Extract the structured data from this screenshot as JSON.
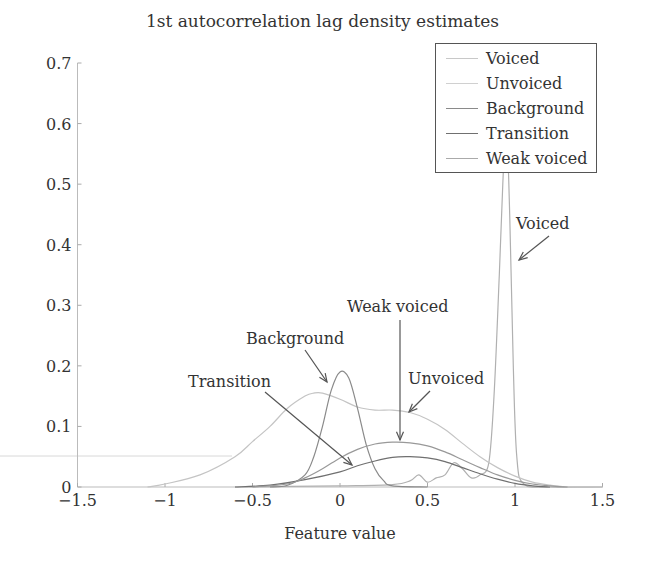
{
  "chart_data": {
    "type": "line",
    "title": "1st autocorrelation lag density estimates",
    "xlabel": "Feature value",
    "ylabel": "",
    "xlim": [
      -1.5,
      1.5
    ],
    "ylim": [
      0,
      0.7
    ],
    "xticks": [
      "-1.5",
      "-1",
      "-0.5",
      "0",
      "0.5",
      "1",
      "1.5"
    ],
    "yticks": [
      "0",
      "0.1",
      "0.2",
      "0.3",
      "0.4",
      "0.5",
      "0.6",
      "0.7"
    ],
    "grid": false,
    "legend_position": "upper right",
    "series": [
      {
        "name": "Voiced",
        "color": "#b0b0b0",
        "x": [
          -0.6,
          0.0,
          0.3,
          0.4,
          0.45,
          0.5,
          0.55,
          0.6,
          0.65,
          0.7,
          0.75,
          0.8,
          0.85,
          0.88,
          0.91,
          0.93,
          0.95,
          0.97,
          0.99,
          1.01,
          1.05,
          1.2,
          1.5
        ],
        "y": [
          0,
          0.002,
          0.004,
          0.01,
          0.02,
          0.008,
          0.015,
          0.02,
          0.04,
          0.03,
          0.015,
          0.02,
          0.04,
          0.15,
          0.35,
          0.5,
          0.6,
          0.45,
          0.2,
          0.05,
          0.005,
          0,
          0
        ]
      },
      {
        "name": "Unvoiced",
        "color": "#c4c4c4",
        "x": [
          -1.1,
          -1.0,
          -0.8,
          -0.6,
          -0.5,
          -0.4,
          -0.3,
          -0.2,
          -0.15,
          -0.1,
          0.0,
          0.1,
          0.2,
          0.3,
          0.4,
          0.5,
          0.6,
          0.7,
          0.8,
          0.9,
          1.0,
          1.1,
          1.2,
          1.3,
          1.5
        ],
        "y": [
          0,
          0.005,
          0.02,
          0.05,
          0.075,
          0.1,
          0.13,
          0.15,
          0.155,
          0.155,
          0.145,
          0.132,
          0.127,
          0.127,
          0.123,
          0.112,
          0.095,
          0.072,
          0.05,
          0.032,
          0.018,
          0.008,
          0.003,
          0,
          0
        ]
      },
      {
        "name": "Background",
        "color": "#8a8a8a",
        "x": [
          -0.4,
          -0.3,
          -0.2,
          -0.15,
          -0.1,
          -0.05,
          0.0,
          0.05,
          0.1,
          0.15,
          0.2,
          0.25,
          0.3,
          0.5
        ],
        "y": [
          0,
          0.003,
          0.02,
          0.05,
          0.1,
          0.16,
          0.19,
          0.18,
          0.13,
          0.07,
          0.03,
          0.01,
          0.002,
          0
        ]
      },
      {
        "name": "Transition",
        "color": "#707070",
        "x": [
          -0.6,
          -0.4,
          -0.2,
          0.0,
          0.1,
          0.2,
          0.3,
          0.4,
          0.5,
          0.6,
          0.7,
          0.8,
          0.9,
          1.0,
          1.1,
          1.2
        ],
        "y": [
          0,
          0.003,
          0.012,
          0.025,
          0.035,
          0.043,
          0.049,
          0.05,
          0.048,
          0.042,
          0.032,
          0.022,
          0.013,
          0.006,
          0.002,
          0
        ]
      },
      {
        "name": "Weak voiced",
        "color": "#999999",
        "x": [
          -0.5,
          -0.3,
          -0.2,
          -0.1,
          0.0,
          0.1,
          0.2,
          0.3,
          0.4,
          0.5,
          0.6,
          0.7,
          0.8,
          0.9,
          1.0,
          1.1,
          1.2,
          1.3
        ],
        "y": [
          0,
          0.005,
          0.015,
          0.03,
          0.048,
          0.062,
          0.071,
          0.074,
          0.073,
          0.068,
          0.058,
          0.045,
          0.032,
          0.02,
          0.011,
          0.005,
          0.002,
          0
        ]
      }
    ],
    "annotations": [
      {
        "text": "Voiced",
        "arrow_to": [
          0.9,
          0.38
        ]
      },
      {
        "text": "Unvoiced",
        "arrow_to": [
          0.55,
          0.09
        ]
      },
      {
        "text": "Weak voiced",
        "arrow_to": [
          0.36,
          0.075
        ]
      },
      {
        "text": "Background",
        "arrow_to": [
          -0.07,
          0.17
        ]
      },
      {
        "text": "Transition",
        "arrow_to": [
          0.35,
          0.045
        ]
      }
    ]
  },
  "legend": {
    "items": [
      "Voiced",
      "Unvoiced",
      "Background",
      "Transition",
      "Weak voiced"
    ]
  },
  "annotations": {
    "voiced": "Voiced",
    "unvoiced": "Unvoiced",
    "weak_voiced": "Weak voiced",
    "background": "Background",
    "transition": "Transition"
  }
}
